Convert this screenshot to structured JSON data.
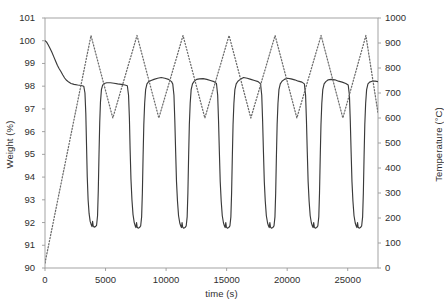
{
  "chart_data": {
    "type": "line",
    "title": "",
    "xlabel": "time (s)",
    "ylabel": "Weight (%)",
    "y2label": "Temperature (°C)",
    "xlim": [
      0,
      27500
    ],
    "ylim": [
      90,
      101
    ],
    "y2lim": [
      0,
      1000
    ],
    "xticks": [
      0,
      5000,
      10000,
      15000,
      20000,
      25000
    ],
    "xticklabels": [
      "0",
      "5000",
      "10000",
      "15000",
      "20000",
      "25000"
    ],
    "yticks": [
      90,
      91,
      92,
      93,
      94,
      95,
      96,
      97,
      98,
      99,
      100,
      101
    ],
    "yticklabels": [
      "90",
      "91",
      "92",
      "93",
      "94",
      "95",
      "96",
      "97",
      "98",
      "99",
      "100",
      "101"
    ],
    "y2ticks": [
      0,
      100,
      200,
      300,
      400,
      500,
      600,
      700,
      800,
      900,
      1000
    ],
    "y2ticklabels": [
      "0",
      "100",
      "200",
      "300",
      "400",
      "500",
      "600",
      "700",
      "800",
      "900",
      "1000"
    ],
    "grid": false,
    "legend": "none",
    "colors": {
      "weight_line": "#3a3a3a",
      "temperature_line": "#6b6b6b",
      "axis": "#9a9a9a",
      "text": "#2f2f2f"
    },
    "series": [
      {
        "name": "Weight (%)",
        "axis": "left",
        "style": "solid",
        "units": "%",
        "points": [
          [
            0,
            100.0
          ],
          [
            120,
            99.95
          ],
          [
            260,
            99.82
          ],
          [
            400,
            99.68
          ],
          [
            560,
            99.5
          ],
          [
            720,
            99.3
          ],
          [
            880,
            99.1
          ],
          [
            1020,
            98.92
          ],
          [
            1160,
            98.78
          ],
          [
            1300,
            98.66
          ],
          [
            1460,
            98.5
          ],
          [
            1620,
            98.36
          ],
          [
            1780,
            98.26
          ],
          [
            1960,
            98.18
          ],
          [
            2150,
            98.12
          ],
          [
            2400,
            98.08
          ],
          [
            2700,
            98.05
          ],
          [
            3000,
            98.03
          ],
          [
            3200,
            98.0
          ],
          [
            3300,
            97.7
          ],
          [
            3370,
            96.8
          ],
          [
            3430,
            95.4
          ],
          [
            3490,
            94.0
          ],
          [
            3560,
            93.0
          ],
          [
            3640,
            92.4
          ],
          [
            3730,
            92.05
          ],
          [
            3820,
            91.9
          ],
          [
            3880,
            91.82
          ],
          [
            3930,
            92.05
          ],
          [
            3980,
            91.85
          ],
          [
            4060,
            91.8
          ],
          [
            4160,
            91.82
          ],
          [
            4260,
            91.88
          ],
          [
            4340,
            92.3
          ],
          [
            4400,
            93.4
          ],
          [
            4460,
            95.0
          ],
          [
            4520,
            96.4
          ],
          [
            4580,
            97.3
          ],
          [
            4660,
            97.85
          ],
          [
            4760,
            98.05
          ],
          [
            4900,
            98.12
          ],
          [
            5100,
            98.15
          ],
          [
            5400,
            98.15
          ],
          [
            5700,
            98.13
          ],
          [
            6000,
            98.1
          ],
          [
            6300,
            98.08
          ],
          [
            6600,
            98.05
          ],
          [
            6800,
            98.02
          ],
          [
            6900,
            97.6
          ],
          [
            6970,
            96.6
          ],
          [
            7030,
            95.2
          ],
          [
            7100,
            93.9
          ],
          [
            7180,
            93.0
          ],
          [
            7270,
            92.35
          ],
          [
            7370,
            92.0
          ],
          [
            7450,
            91.85
          ],
          [
            7510,
            91.78
          ],
          [
            7560,
            92.0
          ],
          [
            7610,
            91.8
          ],
          [
            7690,
            91.75
          ],
          [
            7800,
            91.78
          ],
          [
            7900,
            91.85
          ],
          [
            7980,
            92.25
          ],
          [
            8040,
            93.3
          ],
          [
            8100,
            94.9
          ],
          [
            8160,
            96.3
          ],
          [
            8230,
            97.25
          ],
          [
            8310,
            97.85
          ],
          [
            8420,
            98.1
          ],
          [
            8560,
            98.2
          ],
          [
            8760,
            98.25
          ],
          [
            9000,
            98.3
          ],
          [
            9300,
            98.35
          ],
          [
            9600,
            98.38
          ],
          [
            9900,
            98.35
          ],
          [
            10200,
            98.3
          ],
          [
            10450,
            98.2
          ],
          [
            10550,
            98.1
          ],
          [
            10650,
            97.6
          ],
          [
            10720,
            96.5
          ],
          [
            10790,
            95.1
          ],
          [
            10860,
            93.8
          ],
          [
            10940,
            92.95
          ],
          [
            11030,
            92.3
          ],
          [
            11130,
            91.98
          ],
          [
            11210,
            91.85
          ],
          [
            11270,
            91.78
          ],
          [
            11320,
            92.0
          ],
          [
            11370,
            91.8
          ],
          [
            11450,
            91.75
          ],
          [
            11560,
            91.78
          ],
          [
            11660,
            91.85
          ],
          [
            11740,
            92.25
          ],
          [
            11800,
            93.3
          ],
          [
            11860,
            94.9
          ],
          [
            11920,
            96.3
          ],
          [
            11990,
            97.25
          ],
          [
            12070,
            97.85
          ],
          [
            12180,
            98.1
          ],
          [
            12320,
            98.22
          ],
          [
            12520,
            98.3
          ],
          [
            12760,
            98.32
          ],
          [
            13060,
            98.33
          ],
          [
            13360,
            98.3
          ],
          [
            13660,
            98.25
          ],
          [
            13960,
            98.2
          ],
          [
            14160,
            98.12
          ],
          [
            14260,
            97.6
          ],
          [
            14330,
            96.5
          ],
          [
            14400,
            95.1
          ],
          [
            14470,
            93.8
          ],
          [
            14550,
            92.95
          ],
          [
            14640,
            92.3
          ],
          [
            14740,
            91.98
          ],
          [
            14820,
            91.85
          ],
          [
            14880,
            91.78
          ],
          [
            14930,
            92.0
          ],
          [
            14980,
            91.8
          ],
          [
            15060,
            91.75
          ],
          [
            15170,
            91.78
          ],
          [
            15270,
            91.85
          ],
          [
            15350,
            92.25
          ],
          [
            15410,
            93.3
          ],
          [
            15470,
            94.9
          ],
          [
            15530,
            96.3
          ],
          [
            15600,
            97.25
          ],
          [
            15680,
            97.85
          ],
          [
            15790,
            98.1
          ],
          [
            15930,
            98.22
          ],
          [
            16130,
            98.3
          ],
          [
            16400,
            98.38
          ],
          [
            16700,
            98.35
          ],
          [
            17000,
            98.3
          ],
          [
            17300,
            98.25
          ],
          [
            17600,
            98.2
          ],
          [
            17800,
            98.1
          ],
          [
            17900,
            97.6
          ],
          [
            17970,
            96.5
          ],
          [
            18040,
            95.1
          ],
          [
            18110,
            93.8
          ],
          [
            18190,
            92.95
          ],
          [
            18280,
            92.3
          ],
          [
            18380,
            91.98
          ],
          [
            18460,
            91.85
          ],
          [
            18520,
            91.78
          ],
          [
            18570,
            92.0
          ],
          [
            18620,
            91.8
          ],
          [
            18700,
            91.75
          ],
          [
            18810,
            91.78
          ],
          [
            18910,
            91.85
          ],
          [
            18990,
            92.25
          ],
          [
            19050,
            93.3
          ],
          [
            19110,
            94.9
          ],
          [
            19170,
            96.3
          ],
          [
            19240,
            97.25
          ],
          [
            19320,
            97.85
          ],
          [
            19430,
            98.1
          ],
          [
            19570,
            98.22
          ],
          [
            19770,
            98.3
          ],
          [
            20020,
            98.35
          ],
          [
            20320,
            98.32
          ],
          [
            20620,
            98.28
          ],
          [
            20920,
            98.22
          ],
          [
            21220,
            98.18
          ],
          [
            21420,
            98.1
          ],
          [
            21520,
            97.6
          ],
          [
            21590,
            96.5
          ],
          [
            21660,
            95.1
          ],
          [
            21730,
            93.8
          ],
          [
            21810,
            92.95
          ],
          [
            21900,
            92.3
          ],
          [
            22000,
            91.98
          ],
          [
            22080,
            91.85
          ],
          [
            22140,
            91.78
          ],
          [
            22190,
            92.0
          ],
          [
            22240,
            91.8
          ],
          [
            22320,
            91.75
          ],
          [
            22430,
            91.78
          ],
          [
            22530,
            91.85
          ],
          [
            22610,
            92.25
          ],
          [
            22670,
            93.3
          ],
          [
            22730,
            94.9
          ],
          [
            22790,
            96.3
          ],
          [
            22860,
            97.25
          ],
          [
            22940,
            97.85
          ],
          [
            23050,
            98.1
          ],
          [
            23190,
            98.2
          ],
          [
            23390,
            98.28
          ],
          [
            23640,
            98.3
          ],
          [
            23940,
            98.28
          ],
          [
            24240,
            98.22
          ],
          [
            24540,
            98.18
          ],
          [
            24840,
            98.12
          ],
          [
            25040,
            98.05
          ],
          [
            25140,
            97.6
          ],
          [
            25210,
            96.5
          ],
          [
            25280,
            95.1
          ],
          [
            25350,
            93.8
          ],
          [
            25430,
            92.95
          ],
          [
            25520,
            92.3
          ],
          [
            25620,
            91.98
          ],
          [
            25700,
            91.85
          ],
          [
            25760,
            91.78
          ],
          [
            25810,
            92.0
          ],
          [
            25860,
            91.8
          ],
          [
            25940,
            91.75
          ],
          [
            26050,
            91.78
          ],
          [
            26150,
            91.85
          ],
          [
            26230,
            92.25
          ],
          [
            26290,
            93.3
          ],
          [
            26350,
            94.9
          ],
          [
            26410,
            96.3
          ],
          [
            26480,
            97.25
          ],
          [
            26560,
            97.85
          ],
          [
            26670,
            98.1
          ],
          [
            26810,
            98.18
          ],
          [
            27010,
            98.22
          ],
          [
            27260,
            98.22
          ],
          [
            27500,
            98.2
          ]
        ]
      },
      {
        "name": "Temperature (°C)",
        "axis": "right",
        "style": "dotted",
        "units": "°C",
        "points": [
          [
            0,
            20
          ],
          [
            3800,
            930
          ],
          [
            5600,
            600
          ],
          [
            7600,
            930
          ],
          [
            9400,
            600
          ],
          [
            11400,
            930
          ],
          [
            13200,
            600
          ],
          [
            15200,
            930
          ],
          [
            17000,
            600
          ],
          [
            19000,
            930
          ],
          [
            20800,
            600
          ],
          [
            22800,
            930
          ],
          [
            24600,
            600
          ],
          [
            26500,
            930
          ],
          [
            27500,
            620
          ]
        ]
      }
    ],
    "annotations": []
  }
}
